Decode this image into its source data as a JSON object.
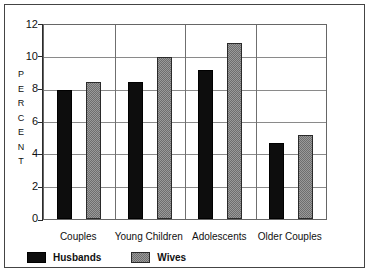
{
  "chart_data": {
    "type": "bar",
    "title": "",
    "subtitle": "",
    "xlabel": "",
    "ylabel": "PERCENT",
    "ylabel_letters": [
      "P",
      "E",
      "R",
      "C",
      "E",
      "N",
      "T"
    ],
    "ylim": [
      0,
      12
    ],
    "ytick_labels": [
      "12",
      "10",
      "8",
      "6",
      "4",
      "2",
      "0"
    ],
    "ytick_values": [
      12,
      10,
      8,
      6,
      4,
      2,
      0
    ],
    "grid": true,
    "grid_orientation": "both",
    "legend_position": "bottom-left",
    "categories": [
      "Couples",
      "Young Children",
      "Adolescents",
      "Older Couples"
    ],
    "series": [
      {
        "name": "Husbands",
        "color": "#0d0d0d",
        "fill": "solid-black",
        "values": [
          8.0,
          8.5,
          9.2,
          4.7
        ]
      },
      {
        "name": "Wives",
        "color": "#9a9a9a",
        "fill": "gray-checkered",
        "values": [
          8.5,
          10.0,
          10.9,
          5.2
        ]
      }
    ]
  },
  "legend": {
    "items": [
      {
        "label": "Husbands",
        "swatch": "black-solid-swatch"
      },
      {
        "label": "Wives",
        "swatch": "gray-checkered-swatch"
      }
    ]
  },
  "axis": {
    "y_title": "PERCENT",
    "y_ticks": [
      "12",
      "10",
      "8",
      "6",
      "4",
      "2",
      "0"
    ],
    "x_ticks": [
      "Couples",
      "Young Children",
      "Adolescents",
      "Older Couples"
    ]
  }
}
